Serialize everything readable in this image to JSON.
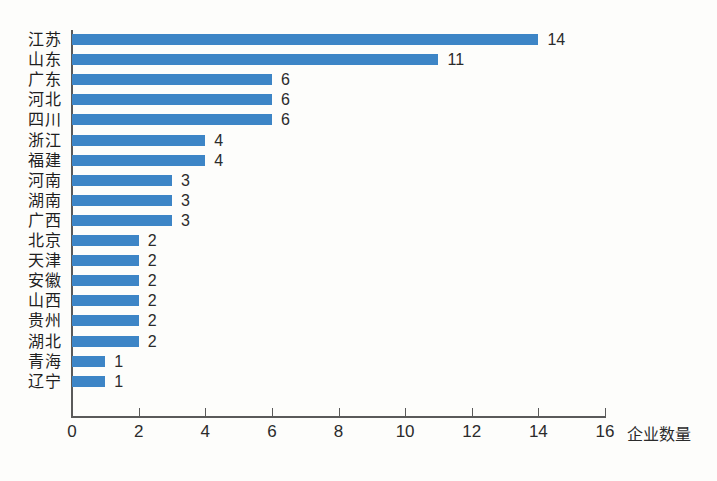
{
  "chart_data": {
    "type": "bar",
    "orientation": "horizontal",
    "title": "",
    "subtitle": "",
    "xlabel": "企业数量",
    "ylabel": "",
    "xlim": [
      0,
      16
    ],
    "xticks": [
      0,
      2,
      4,
      6,
      8,
      10,
      12,
      14,
      16
    ],
    "xtick_labels": [
      "0",
      "2",
      "4",
      "6",
      "8",
      "10",
      "12",
      "14",
      "16"
    ],
    "grid": false,
    "legend": null,
    "bar_color": "#3d85c6",
    "axis_color": "#5a5a5a",
    "background_color": "#fdfdfb",
    "categories": [
      "江苏",
      "山东",
      "广东",
      "河北",
      "四川",
      "浙江",
      "福建",
      "河南",
      "湖南",
      "广西",
      "北京",
      "天津",
      "安徽",
      "山西",
      "贵州",
      "湖北",
      "青海",
      "辽宁"
    ],
    "values": [
      14,
      11,
      6,
      6,
      6,
      4,
      4,
      3,
      3,
      3,
      2,
      2,
      2,
      2,
      2,
      2,
      1,
      1
    ],
    "data_labels": [
      "14",
      "11",
      "6",
      "6",
      "6",
      "4",
      "4",
      "3",
      "3",
      "3",
      "2",
      "2",
      "2",
      "2",
      "2",
      "2",
      "1",
      "1"
    ],
    "bars": [
      {
        "category": "江苏",
        "value": 14,
        "label": "14"
      },
      {
        "category": "山东",
        "value": 11,
        "label": "11"
      },
      {
        "category": "广东",
        "value": 6,
        "label": "6"
      },
      {
        "category": "河北",
        "value": 6,
        "label": "6"
      },
      {
        "category": "四川",
        "value": 6,
        "label": "6"
      },
      {
        "category": "浙江",
        "value": 4,
        "label": "4"
      },
      {
        "category": "福建",
        "value": 4,
        "label": "4"
      },
      {
        "category": "河南",
        "value": 3,
        "label": "3"
      },
      {
        "category": "湖南",
        "value": 3,
        "label": "3"
      },
      {
        "category": "广西",
        "value": 3,
        "label": "3"
      },
      {
        "category": "北京",
        "value": 2,
        "label": "2"
      },
      {
        "category": "天津",
        "value": 2,
        "label": "2"
      },
      {
        "category": "安徽",
        "value": 2,
        "label": "2"
      },
      {
        "category": "山西",
        "value": 2,
        "label": "2"
      },
      {
        "category": "贵州",
        "value": 2,
        "label": "2"
      },
      {
        "category": "湖北",
        "value": 2,
        "label": "2"
      },
      {
        "category": "青海",
        "value": 1,
        "label": "1"
      },
      {
        "category": "辽宁",
        "value": 1,
        "label": "1"
      }
    ]
  }
}
